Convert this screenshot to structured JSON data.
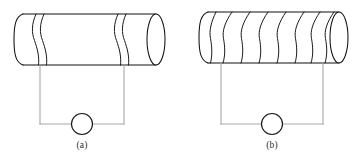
{
  "figure": {
    "background_color": "#ffffff",
    "outline_color": "#111111",
    "wire_color": "#a8a8a8",
    "meter_color": "#1a1a1a"
  },
  "panels": [
    {
      "id": "panel-a",
      "label": "(a)",
      "turns": 2,
      "coil_count_description": "two widely spaced turns",
      "cylinder": {
        "left_x": 14,
        "right_x": 165,
        "top_y": 14,
        "bottom_y": 65,
        "cap_rx": 9,
        "cap_ry": 25.5
      },
      "coil_x_positions": [
        36,
        44,
        118,
        126
      ],
      "circuit": {
        "left_lead_x": 40,
        "right_lead_x": 124,
        "top_y": 65,
        "bottom_y": 124,
        "meter_cx": 82,
        "meter_cy": 124,
        "meter_r": 10.5
      },
      "label_x": 82,
      "label_y": 148
    },
    {
      "id": "panel-b",
      "label": "(b)",
      "turns": 8,
      "coil_count_description": "eight closely spaced turns",
      "cylinder": {
        "left_x": 199,
        "right_x": 348,
        "top_y": 12,
        "bottom_y": 63,
        "cap_rx": 9,
        "cap_ry": 25.5
      },
      "coil_x_positions": [
        221,
        239,
        257,
        275,
        293,
        311,
        326,
        340
      ],
      "circuit": {
        "left_lead_x": 221,
        "right_lead_x": 323,
        "top_y": 63,
        "bottom_y": 124,
        "meter_cx": 272,
        "meter_cy": 124,
        "meter_r": 10.5
      },
      "label_x": 272,
      "label_y": 148
    }
  ]
}
